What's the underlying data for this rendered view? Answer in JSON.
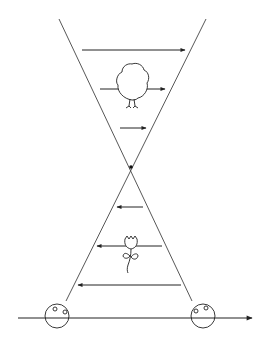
{
  "diagram": {
    "colors": {
      "stroke": "#222222",
      "background": "#ffffff"
    },
    "focal_point": {
      "x": 131,
      "y": 167
    },
    "upper_arrows": [
      {
        "x1": 82,
        "x2": 185,
        "y": 50,
        "direction": "right"
      },
      {
        "x1": 100,
        "x2": 165,
        "y": 89,
        "direction": "right"
      },
      {
        "x1": 120,
        "x2": 146,
        "y": 128,
        "direction": "right"
      }
    ],
    "lower_arrows": [
      {
        "x1": 143,
        "x2": 117,
        "y": 207,
        "direction": "left"
      },
      {
        "x1": 162,
        "x2": 97,
        "y": 246,
        "direction": "left"
      },
      {
        "x1": 181,
        "x2": 78,
        "y": 285,
        "direction": "left"
      }
    ],
    "objects": [
      {
        "name": "tree",
        "position": "upper",
        "orientation": "upright"
      },
      {
        "name": "flower",
        "position": "lower",
        "orientation": "upright"
      }
    ],
    "eyes": [
      {
        "side": "left",
        "cx": 57,
        "cy": 316
      },
      {
        "side": "right",
        "cx": 203,
        "cy": 316
      }
    ],
    "axis": {
      "x1": 18,
      "x2": 252,
      "y": 318,
      "direction": "right"
    }
  },
  "caption": ""
}
